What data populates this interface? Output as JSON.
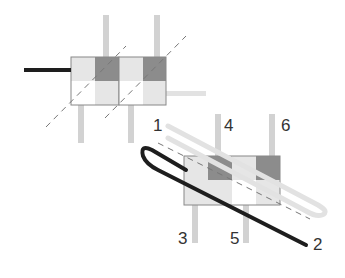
{
  "diagram": {
    "title": "",
    "colors": {
      "pin": "#d2d2d2",
      "dark_cell": "#8c8c8c",
      "light_cell": "#e6e6e6",
      "white_cell": "#ffffff",
      "outline": "#888888",
      "black_wire": "#1e1e1e",
      "gray_wire": "#e2e2e2",
      "dashed": "#777777",
      "label": "#333333"
    },
    "labels": {
      "l1": "1",
      "l2": "2",
      "l3": "3",
      "l4": "4",
      "l5": "5",
      "l6": "6"
    },
    "upper_assembly": {
      "description": "Two square components side by side with diagonal dashed guide lines, black wire entering from left, gray wire exiting right"
    },
    "lower_assembly": {
      "description": "Single rectangular component with pins 3,4,5,6; black wire looping from upper-left to terminal 2; gray wire from terminal 1 looping over"
    }
  }
}
